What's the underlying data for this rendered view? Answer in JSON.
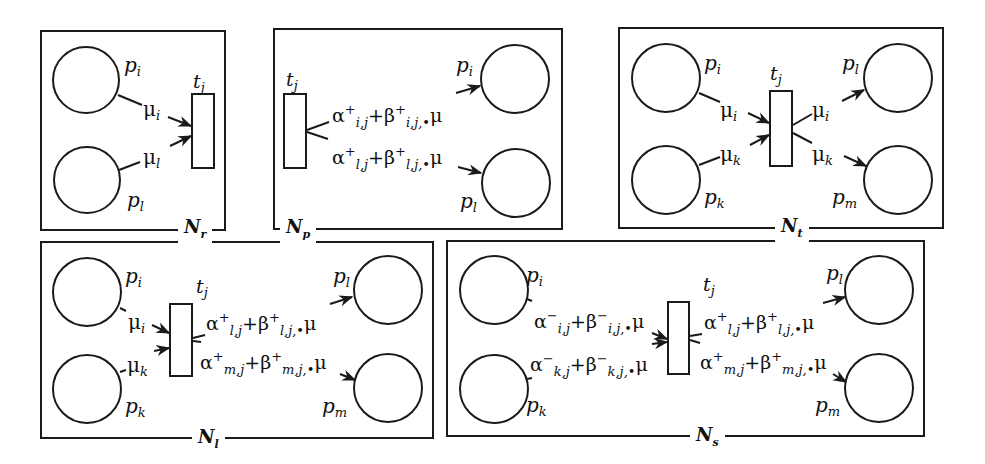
{
  "figure": {
    "panels": [
      {
        "id": "N_r",
        "name": "N",
        "subscript": "r",
        "transition": "t",
        "transition_sub": "j",
        "places": [
          {
            "label": "p",
            "sub": "i"
          },
          {
            "label": "p",
            "sub": "l"
          }
        ],
        "input_arcs": [
          {
            "weight": "μ",
            "sub": "i"
          },
          {
            "weight": "μ",
            "sub": "l"
          }
        ],
        "output_arcs": []
      },
      {
        "id": "N_p",
        "name": "N",
        "subscript": "p",
        "transition": "t",
        "transition_sub": "j",
        "places": [
          {
            "label": "p",
            "sub": "i"
          },
          {
            "label": "p",
            "sub": "l"
          }
        ],
        "input_arcs": [],
        "output_arcs": [
          {
            "weight": "α⁺ᵢ,ⱼ+β⁺ᵢ,ⱼ,•μ",
            "alpha": "α",
            "alpha_sup": "+",
            "alpha_sub": "i,j",
            "beta": "β",
            "beta_sup": "+",
            "beta_sub": "i,j,•",
            "mu": "μ"
          },
          {
            "weight": "α⁺ₗ,ⱼ+β⁺ₗ,ⱼ,•μ",
            "alpha": "α",
            "alpha_sup": "+",
            "alpha_sub": "l,j",
            "beta": "β",
            "beta_sup": "+",
            "beta_sub": "l,j,•",
            "mu": "μ"
          }
        ]
      },
      {
        "id": "N_t",
        "name": "N",
        "subscript": "t",
        "transition": "t",
        "transition_sub": "j",
        "places": [
          {
            "label": "p",
            "sub": "i"
          },
          {
            "label": "p",
            "sub": "k"
          },
          {
            "label": "p",
            "sub": "l"
          },
          {
            "label": "p",
            "sub": "m"
          }
        ],
        "input_arcs": [
          {
            "weight": "μ",
            "sub": "i"
          },
          {
            "weight": "μ",
            "sub": "k"
          }
        ],
        "output_arcs": [
          {
            "weight": "μ",
            "sub": "i"
          },
          {
            "weight": "μ",
            "sub": "k"
          }
        ]
      },
      {
        "id": "N_l",
        "name": "N",
        "subscript": "l",
        "transition": "t",
        "transition_sub": "j",
        "places": [
          {
            "label": "p",
            "sub": "i"
          },
          {
            "label": "p",
            "sub": "k"
          },
          {
            "label": "p",
            "sub": "l"
          },
          {
            "label": "p",
            "sub": "m"
          }
        ],
        "input_arcs": [
          {
            "weight": "μ",
            "sub": "i"
          },
          {
            "weight": "μ",
            "sub": "k"
          }
        ],
        "output_arcs": [
          {
            "alpha": "α",
            "alpha_sup": "+",
            "alpha_sub": "l,j",
            "beta": "β",
            "beta_sup": "+",
            "beta_sub": "l,j,•",
            "mu": "μ"
          },
          {
            "alpha": "α",
            "alpha_sup": "+",
            "alpha_sub": "m,j",
            "beta": "β",
            "beta_sup": "+",
            "beta_sub": "m,j,•",
            "mu": "μ"
          }
        ]
      },
      {
        "id": "N_s",
        "name": "N",
        "subscript": "s",
        "transition": "t",
        "transition_sub": "j",
        "places": [
          {
            "label": "p",
            "sub": "i"
          },
          {
            "label": "p",
            "sub": "k"
          },
          {
            "label": "p",
            "sub": "l"
          },
          {
            "label": "p",
            "sub": "m"
          }
        ],
        "input_arcs": [
          {
            "alpha": "α",
            "alpha_sup": "−",
            "alpha_sub": "i,j",
            "beta": "β",
            "beta_sup": "−",
            "beta_sub": "i,j,•",
            "mu": "μ"
          },
          {
            "alpha": "α",
            "alpha_sup": "−",
            "alpha_sub": "k,j",
            "beta": "β",
            "beta_sup": "−",
            "beta_sub": "k,j,•",
            "mu": "μ"
          }
        ],
        "output_arcs": [
          {
            "alpha": "α",
            "alpha_sup": "+",
            "alpha_sub": "l,j",
            "beta": "β",
            "beta_sup": "+",
            "beta_sub": "l,j,•",
            "mu": "μ"
          },
          {
            "alpha": "α",
            "alpha_sup": "+",
            "alpha_sub": "m,j",
            "beta": "β",
            "beta_sup": "+",
            "beta_sub": "m,j,•",
            "mu": "μ"
          }
        ]
      }
    ],
    "colors": {
      "stroke": "#1a1a1a",
      "background": "#ffffff"
    }
  }
}
